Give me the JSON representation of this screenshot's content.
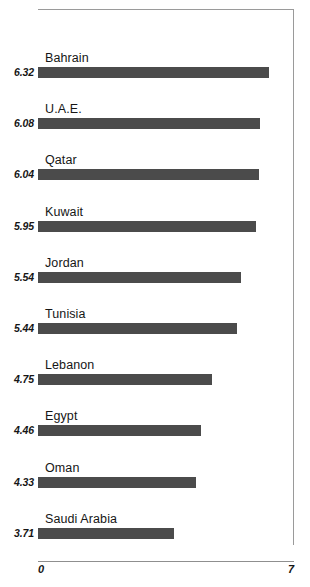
{
  "chart_data": {
    "type": "bar",
    "orientation": "horizontal",
    "title": "",
    "subtitle": "",
    "xlabel": "",
    "ylabel": "",
    "xlim": [
      0,
      7
    ],
    "grid": false,
    "legend": null,
    "axis_tick_labels": [
      "0",
      "7"
    ],
    "bar_color": "#4b4b4b",
    "categories": [
      "Bahrain",
      "U.A.E.",
      "Qatar",
      "Kuwait",
      "Jordan",
      "Tunisia",
      "Lebanon",
      "Egypt",
      "Oman",
      "Saudi Arabia"
    ],
    "values": [
      6.32,
      6.08,
      6.04,
      5.95,
      5.54,
      5.44,
      4.75,
      4.46,
      4.33,
      3.71
    ],
    "value_labels": [
      "6.32",
      "6.08",
      "6.04",
      "5.95",
      "5.54",
      "5.44",
      "4.75",
      "4.46",
      "4.33",
      "3.71"
    ],
    "bars": [
      {
        "category": "Bahrain",
        "value": 6.32,
        "value_label": "6.32"
      },
      {
        "category": "U.A.E.",
        "value": 6.08,
        "value_label": "6.08"
      },
      {
        "category": "Qatar",
        "value": 6.04,
        "value_label": "6.04"
      },
      {
        "category": "Kuwait",
        "value": 5.95,
        "value_label": "5.95"
      },
      {
        "category": "Jordan",
        "value": 5.54,
        "value_label": "5.54"
      },
      {
        "category": "Tunisia",
        "value": 5.44,
        "value_label": "5.44"
      },
      {
        "category": "Lebanon",
        "value": 4.75,
        "value_label": "4.75"
      },
      {
        "category": "Egypt",
        "value": 4.46,
        "value_label": "4.46"
      },
      {
        "category": "Oman",
        "value": 4.33,
        "value_label": "4.33"
      },
      {
        "category": "Saudi Arabia",
        "value": 3.71,
        "value_label": "3.71"
      }
    ]
  }
}
